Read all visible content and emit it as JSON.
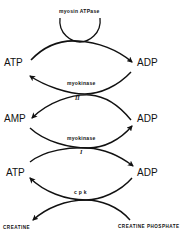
{
  "diagram": {
    "type": "coupled-reaction-scheme",
    "nodes": {
      "atp_top": "ATP",
      "adp_top": "ADP",
      "amp_mid": "AMP",
      "adp_mid": "ADP",
      "atp_bottom": "ATP",
      "adp_bottom": "ADP",
      "creatine": "CREATINE",
      "creatine_phosphate": "CREATINE  PHOSPHATE"
    },
    "enzymes": {
      "myosin": "myosin ATPase",
      "myokinase_upper": "myokinase",
      "myokinase_lower": "myokinase",
      "cpk": "c p k"
    },
    "reaction_numbers": {
      "upper": "II",
      "lower": "I"
    },
    "reactions": [
      {
        "enzyme": "myosin ATPase",
        "from": "ATP",
        "to": "ADP"
      },
      {
        "enzyme": "myokinase",
        "number": "II",
        "from": [
          "ADP"
        ],
        "to": [
          "ATP",
          "AMP"
        ]
      },
      {
        "enzyme": "myokinase",
        "number": "I",
        "from": [
          "AMP",
          "ATP"
        ],
        "to": [
          "ADP",
          "ADP"
        ]
      },
      {
        "enzyme": "c p k",
        "from": [
          "ADP",
          "CREATINE PHOSPHATE"
        ],
        "to": [
          "ATP",
          "CREATINE"
        ]
      }
    ]
  }
}
